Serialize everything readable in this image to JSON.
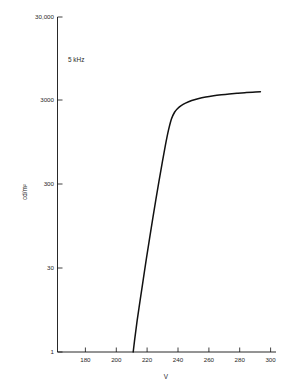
{
  "chart_data": {
    "type": "line",
    "title": "",
    "subtitle": "",
    "xlabel": "V",
    "ylabel": "cd/m²",
    "yscale": "log",
    "xscale": "linear",
    "xlim": [
      170,
      310
    ],
    "ylim": [
      1,
      30000
    ],
    "grid": false,
    "legend": null,
    "annotations": [
      {
        "text": "5 kHz",
        "x": 196,
        "y": 12000
      }
    ],
    "xticks": [
      180,
      200,
      220,
      240,
      260,
      280,
      300
    ],
    "xtick_labels": [
      "180",
      "200",
      "220",
      "240",
      "260",
      "280",
      "300"
    ],
    "yticks": [
      1,
      30,
      300,
      3000,
      30000
    ],
    "ytick_labels": [
      "1",
      "30",
      "300",
      "3000",
      "30,000"
    ],
    "series": [
      {
        "name": "luminance",
        "x": [
          218.5,
          219.5,
          221,
          223,
          225,
          227,
          229,
          231,
          233,
          235,
          237,
          239,
          241,
          243,
          245,
          247,
          249,
          252,
          256,
          260,
          265,
          270,
          275,
          280,
          285,
          290,
          295,
          300
        ],
        "values": [
          1.0,
          1.5,
          2.6,
          5.0,
          9.5,
          18,
          33,
          60,
          108,
          190,
          330,
          560,
          900,
          1300,
          1600,
          1800,
          1950,
          2120,
          2300,
          2430,
          2560,
          2660,
          2740,
          2810,
          2870,
          2920,
          2965,
          3000
        ]
      }
    ]
  },
  "axes": {
    "x_axis_label": "V",
    "y_axis_label": "cd/m²"
  },
  "annotation": {
    "frequency": "5 kHz"
  },
  "colors": {
    "curve": "#111111",
    "axis": "#111111",
    "background": "#ffffff",
    "text": "#1f1f1f"
  }
}
